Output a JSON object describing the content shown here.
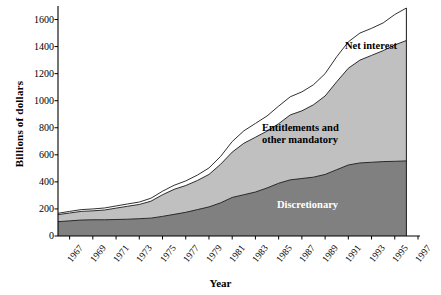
{
  "chart_data": {
    "type": "area",
    "stacked": true,
    "title": "",
    "xlabel": "Year",
    "ylabel": "Billions of dollars",
    "xlim": [
      1966,
      1997
    ],
    "ylim": [
      0,
      1700
    ],
    "grid": false,
    "legend_position": "inline-labels",
    "ytick_labels": [
      "0",
      "200",
      "400",
      "600",
      "800",
      "1000",
      "1200",
      "1400",
      "1600"
    ],
    "ytick_values": [
      0,
      200,
      400,
      600,
      800,
      1000,
      1200,
      1400,
      1600
    ],
    "xtick_labels": [
      "1967",
      "1969",
      "1971",
      "1973",
      "1975",
      "1977",
      "1979",
      "1981",
      "1983",
      "1985",
      "1987",
      "1989",
      "1991",
      "1993",
      "1995",
      "1997"
    ],
    "xtick_values": [
      1967,
      1969,
      1971,
      1973,
      1975,
      1977,
      1979,
      1981,
      1983,
      1985,
      1987,
      1989,
      1991,
      1993,
      1995,
      1997
    ],
    "x": [
      1966,
      1967,
      1968,
      1969,
      1970,
      1971,
      1972,
      1973,
      1974,
      1975,
      1976,
      1977,
      1978,
      1979,
      1980,
      1981,
      1982,
      1983,
      1984,
      1985,
      1986,
      1987,
      1988,
      1989,
      1990,
      1991,
      1992,
      1993,
      1994,
      1995,
      1996
    ],
    "series": [
      {
        "name": "Discretionary",
        "color": "#808080",
        "values": [
          106,
          112,
          118,
          120,
          120,
          122,
          124,
          128,
          132,
          145,
          160,
          175,
          195,
          215,
          245,
          285,
          305,
          325,
          355,
          390,
          415,
          425,
          435,
          455,
          490,
          525,
          540,
          545,
          550,
          552,
          555
        ]
      },
      {
        "name": "Entitlements and other mandatory",
        "color": "#c0c0c0",
        "values": [
          52,
          58,
          64,
          66,
          72,
          84,
          96,
          105,
          125,
          160,
          185,
          198,
          215,
          240,
          285,
          335,
          380,
          405,
          420,
          440,
          480,
          500,
          535,
          580,
          650,
          715,
          760,
          790,
          820,
          860,
          890
        ]
      },
      {
        "name": "Net interest",
        "color": "#ffffff",
        "values": [
          10,
          12,
          13,
          14,
          15,
          16,
          17,
          18,
          22,
          26,
          30,
          34,
          40,
          48,
          58,
          78,
          92,
          102,
          112,
          130,
          134,
          140,
          148,
          165,
          185,
          195,
          200,
          200,
          205,
          225,
          240
        ]
      }
    ],
    "series_totals_note": "Stacked totals rise from ~168 in 1966 to ~1685 in 1996"
  },
  "axis": {
    "ylabel_text": "Billions of dollars",
    "xlabel_text": "Year"
  },
  "series_labels": {
    "net_interest": "Net interest",
    "entitlements_line1": "Entitlements and",
    "entitlements_line2": "other mandatory",
    "discretionary": "Discretionary"
  },
  "colors": {
    "discretionary": "#808080",
    "entitlements": "#c0c0c0",
    "net_interest": "#ffffff",
    "axis": "#000000",
    "outline": "#1a1a1a"
  }
}
